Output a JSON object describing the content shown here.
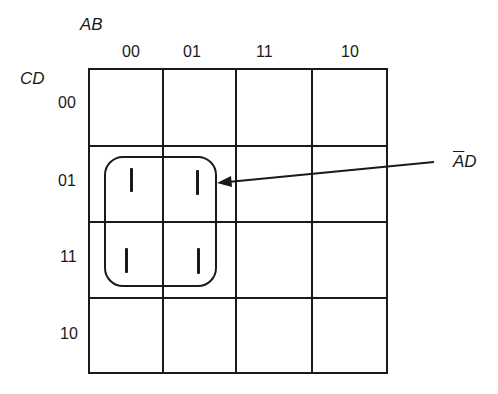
{
  "kmap": {
    "row_var_label": "CD",
    "col_var_label": "AB",
    "col_headers": [
      "00",
      "01",
      "11",
      "10"
    ],
    "row_headers": [
      "00",
      "01",
      "11",
      "10"
    ],
    "cells": [
      [
        "",
        "",
        "",
        ""
      ],
      [
        "1",
        "1",
        "",
        ""
      ],
      [
        "1",
        "1",
        "",
        ""
      ],
      [
        "",
        "",
        "",
        ""
      ]
    ],
    "group": {
      "label_bar": "A",
      "label_rest": "D",
      "term": "A̅D",
      "cells": [
        [
          1,
          0
        ],
        [
          1,
          1
        ],
        [
          2,
          0
        ],
        [
          2,
          1
        ]
      ]
    }
  },
  "colors": {
    "ink": "#1a1a1a",
    "background": "#ffffff"
  }
}
